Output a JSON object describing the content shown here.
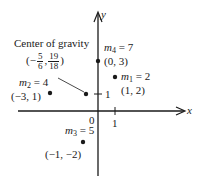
{
  "diagram": {
    "axes": {
      "x_label": "x",
      "y_label": "y",
      "origin_label": "0",
      "x_tick_label": "1",
      "y_tick_label": "1"
    },
    "center_of_gravity": {
      "title": "Center of gravity",
      "open": "(−",
      "x_num": "5",
      "x_den": "6",
      "comma": ",",
      "y_num": "19",
      "y_den": "18",
      "close": ")",
      "x": -0.8333,
      "y": 1.0556
    },
    "masses": [
      {
        "name": "m",
        "sub": "1",
        "eq": " = 2",
        "coord": "(1, 2)",
        "x": 1,
        "y": 2,
        "mass": 2
      },
      {
        "name": "m",
        "sub": "2",
        "eq": " = 4",
        "coord": "(−3, 1)",
        "x": -3,
        "y": 1,
        "mass": 4
      },
      {
        "name": "m",
        "sub": "3",
        "eq": " = 5",
        "coord": "(−1, −2)",
        "x": -1,
        "y": -2,
        "mass": 5
      },
      {
        "name": "m",
        "sub": "4",
        "eq": " = 7",
        "coord": "(0, 3)",
        "x": 0,
        "y": 3,
        "mass": 7
      }
    ],
    "colors": {
      "ink": "#1a1a1a",
      "background": "#ffffff"
    }
  }
}
